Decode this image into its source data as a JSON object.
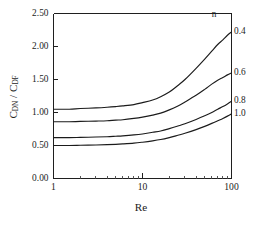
{
  "chart_data": {
    "type": "line",
    "title": "",
    "xlabel": "Re",
    "ylabel": "C_DN / C_DF",
    "ylabel_parts": {
      "num_main": "C",
      "num_sub": "DN",
      "slash": "/",
      "den_main": "C",
      "den_sub": "DF"
    },
    "xscale": "log",
    "xlim": [
      1,
      100
    ],
    "ylim": [
      0.0,
      2.5
    ],
    "grid": false,
    "legend_position": "right-inline",
    "legend_title": "n",
    "yticks": [
      0.0,
      0.5,
      1.0,
      1.5,
      2.0,
      2.5
    ],
    "ytick_labels": [
      "0.00",
      "0.50",
      "1.00",
      "1.50",
      "2.00",
      "2.50"
    ],
    "xticks": [
      1,
      10,
      100
    ],
    "xtick_labels": [
      "1",
      "10",
      "100"
    ],
    "xminor_ticks": [
      2,
      3,
      4,
      5,
      6,
      7,
      8,
      9,
      20,
      30,
      40,
      50,
      60,
      70,
      80,
      90
    ],
    "series": [
      {
        "name": "0.4",
        "label": "0.4",
        "x": [
          1,
          1.5,
          2,
          3,
          4,
          5,
          6,
          8,
          10,
          13,
          16,
          20,
          25,
          30,
          40,
          50,
          60,
          70,
          80,
          90,
          100
        ],
        "values": [
          1.05,
          1.05,
          1.06,
          1.07,
          1.08,
          1.09,
          1.1,
          1.12,
          1.15,
          1.19,
          1.24,
          1.31,
          1.41,
          1.5,
          1.67,
          1.81,
          1.93,
          2.03,
          2.1,
          2.17,
          2.22
        ]
      },
      {
        "name": "0.6",
        "label": "0.6",
        "x": [
          1,
          1.5,
          2,
          3,
          4,
          5,
          6,
          8,
          10,
          13,
          16,
          20,
          25,
          30,
          40,
          50,
          60,
          70,
          80,
          90,
          100
        ],
        "values": [
          0.86,
          0.86,
          0.865,
          0.87,
          0.875,
          0.885,
          0.89,
          0.91,
          0.93,
          0.96,
          0.99,
          1.04,
          1.1,
          1.16,
          1.26,
          1.35,
          1.43,
          1.49,
          1.53,
          1.57,
          1.6
        ]
      },
      {
        "name": "0.8",
        "label": "0.8",
        "x": [
          1,
          1.5,
          2,
          3,
          4,
          5,
          6,
          8,
          10,
          13,
          16,
          20,
          25,
          30,
          40,
          50,
          60,
          70,
          80,
          90,
          100
        ],
        "values": [
          0.62,
          0.62,
          0.623,
          0.628,
          0.633,
          0.64,
          0.646,
          0.66,
          0.675,
          0.7,
          0.72,
          0.755,
          0.795,
          0.83,
          0.895,
          0.95,
          1.0,
          1.05,
          1.09,
          1.13,
          1.17
        ]
      },
      {
        "name": "1.0",
        "label": "1.0",
        "x": [
          1,
          1.5,
          2,
          3,
          4,
          5,
          6,
          8,
          10,
          13,
          16,
          20,
          25,
          30,
          40,
          50,
          60,
          70,
          80,
          90,
          100
        ],
        "values": [
          0.5,
          0.5,
          0.503,
          0.508,
          0.513,
          0.518,
          0.524,
          0.536,
          0.55,
          0.57,
          0.59,
          0.62,
          0.655,
          0.685,
          0.74,
          0.79,
          0.835,
          0.875,
          0.91,
          0.945,
          0.98
        ]
      }
    ],
    "annotations": [
      {
        "text": "n",
        "x": 60,
        "y": 2.48
      },
      {
        "text": "0.4",
        "x": 105,
        "y": 2.22
      },
      {
        "text": "0.6",
        "x": 105,
        "y": 1.6
      },
      {
        "text": "0.8",
        "x": 105,
        "y": 1.17
      },
      {
        "text": "1.0",
        "x": 105,
        "y": 0.98
      }
    ],
    "colors": {
      "curve": "#1b1b1b",
      "axis": "#1f1f1f",
      "background": "#ffffff"
    }
  }
}
